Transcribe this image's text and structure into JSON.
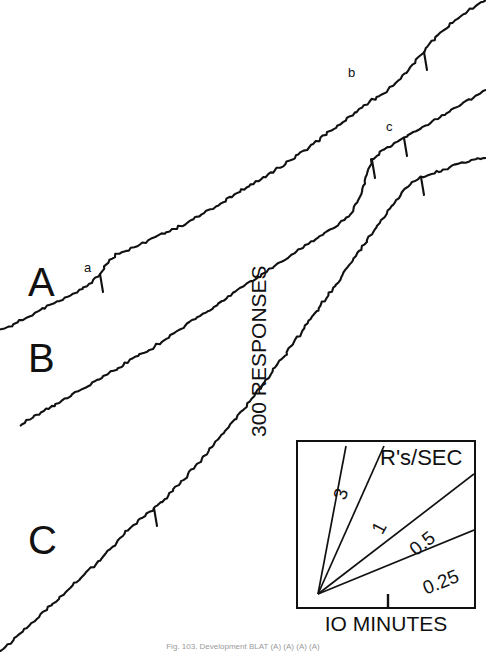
{
  "figure": {
    "background": "#ffffff",
    "ink": "#111111",
    "curve_letters": [
      {
        "label": "A",
        "x": 28,
        "y": 262
      },
      {
        "label": "B",
        "x": 28,
        "y": 338
      },
      {
        "label": "C",
        "x": 28,
        "y": 520
      }
    ],
    "event_letters": [
      {
        "label": "a",
        "x": 84,
        "y": 261
      },
      {
        "label": "b",
        "x": 348,
        "y": 66
      },
      {
        "label": "c",
        "x": 386,
        "y": 120
      }
    ],
    "caption": "Fig. 103.   Development         BLAT (A) (A) (A) (A)"
  },
  "chart_data": {
    "type": "line",
    "title": "",
    "xlabel": "Time",
    "ylabel": "Cumulative responses",
    "grid": false,
    "legend": "none",
    "series": [
      {
        "name": "A",
        "label_letter": "A",
        "event_marker": "a",
        "points": [
          [
            0,
            330
          ],
          [
            14,
            324
          ],
          [
            26,
            318
          ],
          [
            38,
            312
          ],
          [
            50,
            305
          ],
          [
            62,
            299
          ],
          [
            74,
            293
          ],
          [
            84,
            288
          ],
          [
            92,
            283
          ],
          [
            100,
            274
          ],
          [
            108,
            262
          ],
          [
            116,
            254
          ],
          [
            128,
            250
          ],
          [
            140,
            245
          ],
          [
            152,
            239
          ],
          [
            164,
            233
          ],
          [
            176,
            228
          ],
          [
            190,
            221
          ],
          [
            204,
            213
          ],
          [
            218,
            205
          ],
          [
            232,
            196
          ],
          [
            244,
            189
          ],
          [
            256,
            182
          ],
          [
            268,
            175
          ],
          [
            280,
            167
          ],
          [
            292,
            159
          ],
          [
            304,
            151
          ],
          [
            316,
            142
          ],
          [
            328,
            133
          ],
          [
            340,
            124
          ],
          [
            352,
            115
          ],
          [
            362,
            108
          ],
          [
            372,
            100
          ],
          [
            380,
            96
          ],
          [
            388,
            90
          ],
          [
            398,
            80
          ],
          [
            408,
            70
          ],
          [
            418,
            58
          ],
          [
            428,
            46
          ],
          [
            438,
            35
          ],
          [
            448,
            26
          ],
          [
            458,
            18
          ],
          [
            468,
            11
          ],
          [
            478,
            5
          ],
          [
            486,
            0
          ]
        ],
        "pips": [
          {
            "x": 100,
            "y": 274
          },
          {
            "x": 424,
            "y": 52
          }
        ]
      },
      {
        "name": "B",
        "label_letter": "B",
        "event_marker": "b",
        "points": [
          [
            20,
            425
          ],
          [
            32,
            418
          ],
          [
            44,
            411
          ],
          [
            56,
            404
          ],
          [
            68,
            397
          ],
          [
            80,
            390
          ],
          [
            92,
            383
          ],
          [
            104,
            376
          ],
          [
            116,
            369
          ],
          [
            128,
            362
          ],
          [
            140,
            355
          ],
          [
            152,
            348
          ],
          [
            164,
            340
          ],
          [
            176,
            332
          ],
          [
            188,
            324
          ],
          [
            200,
            316
          ],
          [
            212,
            308
          ],
          [
            224,
            300
          ],
          [
            236,
            292
          ],
          [
            248,
            284
          ],
          [
            260,
            276
          ],
          [
            272,
            268
          ],
          [
            284,
            260
          ],
          [
            296,
            252
          ],
          [
            308,
            244
          ],
          [
            320,
            236
          ],
          [
            332,
            228
          ],
          [
            344,
            220
          ],
          [
            352,
            213
          ],
          [
            358,
            200
          ],
          [
            364,
            186
          ],
          [
            368,
            172
          ],
          [
            372,
            160
          ],
          [
            380,
            152
          ],
          [
            392,
            145
          ],
          [
            404,
            138
          ],
          [
            416,
            131
          ],
          [
            428,
            124
          ],
          [
            440,
            117
          ],
          [
            452,
            110
          ],
          [
            464,
            103
          ],
          [
            476,
            96
          ],
          [
            486,
            90
          ]
        ],
        "pips": [
          {
            "x": 372,
            "y": 160
          },
          {
            "x": 404,
            "y": 138
          }
        ]
      },
      {
        "name": "C",
        "label_letter": "C",
        "event_marker": "c",
        "points": [
          [
            0,
            652
          ],
          [
            10,
            643
          ],
          [
            22,
            632
          ],
          [
            34,
            621
          ],
          [
            46,
            610
          ],
          [
            58,
            599
          ],
          [
            70,
            588
          ],
          [
            82,
            577
          ],
          [
            94,
            566
          ],
          [
            104,
            556
          ],
          [
            112,
            547
          ],
          [
            120,
            538
          ],
          [
            128,
            530
          ],
          [
            136,
            523
          ],
          [
            144,
            516
          ],
          [
            152,
            510
          ],
          [
            160,
            503
          ],
          [
            168,
            496
          ],
          [
            176,
            487
          ],
          [
            186,
            477
          ],
          [
            196,
            466
          ],
          [
            206,
            454
          ],
          [
            216,
            442
          ],
          [
            226,
            430
          ],
          [
            236,
            418
          ],
          [
            246,
            406
          ],
          [
            256,
            393
          ],
          [
            266,
            380
          ],
          [
            276,
            367
          ],
          [
            286,
            354
          ],
          [
            296,
            340
          ],
          [
            306,
            326
          ],
          [
            316,
            312
          ],
          [
            326,
            298
          ],
          [
            336,
            284
          ],
          [
            346,
            270
          ],
          [
            356,
            256
          ],
          [
            366,
            242
          ],
          [
            376,
            228
          ],
          [
            386,
            214
          ],
          [
            396,
            200
          ],
          [
            404,
            190
          ],
          [
            412,
            182
          ],
          [
            420,
            177
          ],
          [
            428,
            176
          ],
          [
            436,
            172
          ],
          [
            444,
            170
          ],
          [
            452,
            166
          ],
          [
            462,
            163
          ],
          [
            472,
            160
          ],
          [
            486,
            158
          ]
        ],
        "pips": [
          {
            "x": 154,
            "y": 508
          },
          {
            "x": 421,
            "y": 177
          }
        ]
      }
    ],
    "inset": {
      "type": "line",
      "title": "R's/SEC",
      "xlabel": "IO MINUTES",
      "ylabel": "300 RESPONSES",
      "box": {
        "x": 296,
        "y": 440,
        "width": 180,
        "height": 169
      },
      "origin": {
        "x": 20,
        "y": 152
      },
      "xtick": {
        "x": 90
      },
      "slopes": [
        {
          "label": "3",
          "value": 3,
          "x2": 48,
          "y2": 4,
          "label_x": 34,
          "label_y": 56,
          "rotate": -72
        },
        {
          "label": "1",
          "value": 1,
          "x2": 86,
          "y2": 4,
          "label_x": 72,
          "label_y": 88,
          "rotate": -62
        },
        {
          "label": "0.5",
          "value": 0.5,
          "x2": 176,
          "y2": 32,
          "label_x": 110,
          "label_y": 104,
          "rotate": -38
        },
        {
          "label": "0.25",
          "value": 0.25,
          "x2": 176,
          "y2": 88,
          "label_x": 124,
          "label_y": 140,
          "rotate": -22
        }
      ]
    }
  }
}
